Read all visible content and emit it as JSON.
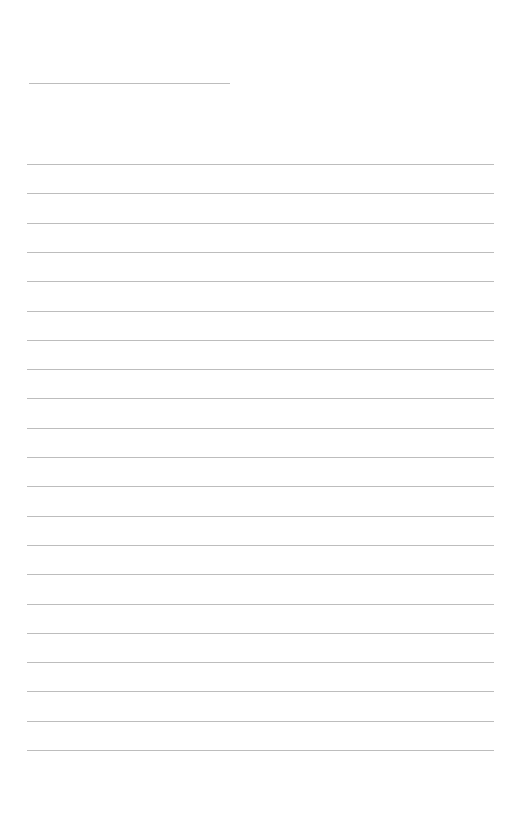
{
  "page": {
    "type": "lined-paper",
    "background": "#ffffff",
    "line_color": "#bdbdbd",
    "header_line": {
      "x": 29,
      "y": 83,
      "width": 201
    },
    "rules": {
      "count": 21,
      "x": 27,
      "width": 467,
      "start_y": 164,
      "spacing": 29.3
    }
  }
}
